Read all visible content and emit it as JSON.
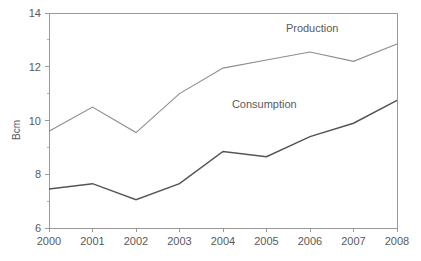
{
  "chart_data": {
    "type": "line",
    "title": "",
    "xlabel": "",
    "ylabel": "Bcm",
    "categories": [
      "2000",
      "2001",
      "2002",
      "2003",
      "2004",
      "2005",
      "2006",
      "2007",
      "2008"
    ],
    "x": [
      2000,
      2001,
      2002,
      2003,
      2004,
      2005,
      2006,
      2007,
      2008
    ],
    "ylim": [
      6,
      14
    ],
    "xlim": [
      2000,
      2008
    ],
    "yticks": [
      6,
      8,
      10,
      12,
      14
    ],
    "ytick_labels": [
      "6",
      "8",
      "10",
      "12",
      "14"
    ],
    "y_minor_ticks": [
      7,
      9,
      11,
      13
    ],
    "xtick_labels": [
      "2000",
      "2001",
      "2002",
      "2003",
      "2004",
      "2005",
      "2006",
      "2007",
      "2008"
    ],
    "grid": false,
    "legend_position": "inline-annotations",
    "series": [
      {
        "name": "Production",
        "color": "#8c8c8c",
        "values": [
          9.6,
          10.5,
          9.55,
          11.0,
          11.95,
          12.25,
          12.55,
          12.2,
          12.85
        ]
      },
      {
        "name": "Consumption",
        "color": "#545454",
        "values": [
          7.45,
          7.65,
          7.05,
          7.65,
          8.85,
          8.65,
          9.4,
          9.9,
          10.75
        ]
      }
    ],
    "annotations": [
      {
        "text": "Production",
        "x": 2006.05,
        "y": 13.28
      },
      {
        "text": "Consumption",
        "x": 2004.95,
        "y": 10.48
      }
    ]
  },
  "axis": {
    "y_title": "Bcm"
  }
}
